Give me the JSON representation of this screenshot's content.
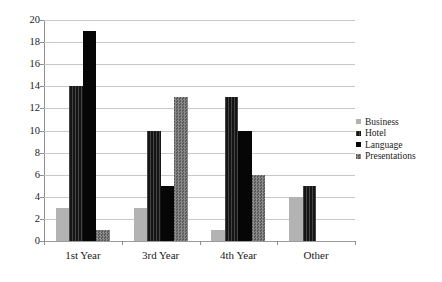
{
  "chart_data": {
    "type": "bar",
    "title": "",
    "subtitle": "",
    "xlabel": "",
    "ylabel": "",
    "categories": [
      "1st Year",
      "3rd Year",
      "4th Year",
      "Other"
    ],
    "series": [
      {
        "name": "Business",
        "color": "#b3b3b3",
        "pattern": "solid-gray",
        "values": [
          3,
          3,
          1,
          4
        ]
      },
      {
        "name": "Hotel",
        "color": "#151515",
        "pattern": "vertical-hatch",
        "values": [
          14,
          10,
          13,
          5
        ]
      },
      {
        "name": "Language",
        "color": "#060606",
        "pattern": "solid-black",
        "values": [
          19,
          5,
          10,
          0
        ]
      },
      {
        "name": "Presentations",
        "color": "#6e6e6e",
        "pattern": "checkered-dots",
        "values": [
          1,
          13,
          6,
          0
        ]
      }
    ],
    "ylim": [
      0,
      20
    ],
    "ytick_step": 2,
    "yticks": [
      "0",
      "2",
      "4",
      "6",
      "8",
      "10",
      "12",
      "14",
      "16",
      "18",
      "20"
    ],
    "grid": true,
    "legend_position": "right"
  },
  "legend": {
    "items": [
      {
        "label": "Business"
      },
      {
        "label": "Hotel"
      },
      {
        "label": "Language"
      },
      {
        "label": "Presentations"
      }
    ]
  }
}
